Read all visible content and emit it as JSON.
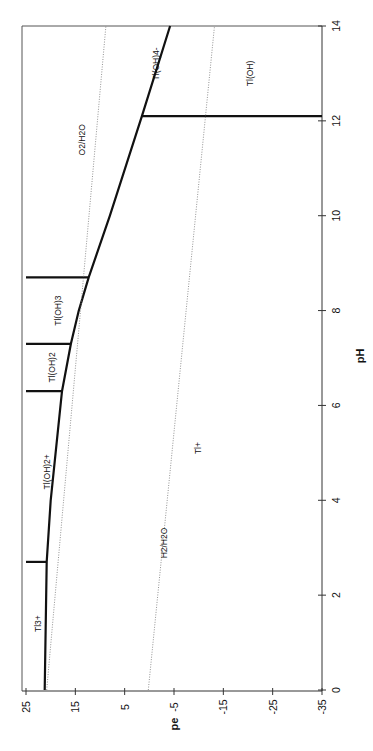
{
  "chart_data": {
    "type": "line",
    "title": "",
    "xlabel": "pH",
    "ylabel": "pe",
    "orientation_note": "figure rotated 90deg: pH axis vertical on right, pe axis horizontal along bottom",
    "xlim": [
      0,
      14
    ],
    "ylim": [
      -35,
      25
    ],
    "x_ticks": [
      "0",
      "2",
      "4",
      "6",
      "8",
      "10",
      "12",
      "14"
    ],
    "y_ticks": [
      "25",
      "15",
      "5",
      "-5",
      "-15",
      "-25",
      "-35"
    ],
    "grid": false,
    "series": [
      {
        "name": "Tl3+/Tl+ and hydroxo-Tl(III)/Tl+ boundary",
        "style": "solid-bold",
        "points": [
          [
            0,
            21.2
          ],
          [
            2.7,
            20.8
          ],
          [
            4.0,
            20.0
          ],
          [
            6.3,
            17.7
          ],
          [
            7.3,
            15.9
          ],
          [
            8.0,
            14.3
          ],
          [
            8.7,
            12.3
          ],
          [
            10.0,
            8.0
          ],
          [
            12.1,
            1.5
          ],
          [
            14,
            -4.2
          ]
        ]
      },
      {
        "name": "Tl3+ / Tl(OH)2+",
        "style": "solid-bold",
        "points": [
          [
            2.7,
            25
          ],
          [
            2.7,
            20.8
          ]
        ]
      },
      {
        "name": "Tl(OH)2+ / Tl(OH)2",
        "style": "solid-bold",
        "points": [
          [
            6.3,
            25
          ],
          [
            6.3,
            17.7
          ]
        ]
      },
      {
        "name": "Tl(OH)2 / Tl(OH)3",
        "style": "solid-bold",
        "points": [
          [
            7.3,
            25
          ],
          [
            7.3,
            15.9
          ]
        ]
      },
      {
        "name": "Tl(OH)3 / Tl(OH)4-",
        "style": "solid-bold",
        "points": [
          [
            8.7,
            25
          ],
          [
            8.7,
            12.3
          ]
        ]
      },
      {
        "name": "Tl+ / Tl(OH)",
        "style": "solid-bold",
        "points": [
          [
            12.1,
            1.5
          ],
          [
            12.1,
            -35
          ]
        ]
      },
      {
        "name": "O2/H2O",
        "style": "dotted",
        "points": [
          [
            0,
            20.8
          ],
          [
            14,
            8.8
          ]
        ]
      },
      {
        "name": "H2/H2O",
        "style": "dotted",
        "points": [
          [
            0,
            0.2
          ],
          [
            14,
            -13.2
          ]
        ]
      }
    ],
    "annotations": [
      {
        "text": "Tl3+",
        "pH": 1.4,
        "pe": 22.5
      },
      {
        "text": "Tl(OH)2+",
        "pH": 4.6,
        "pe": 20.5
      },
      {
        "text": "Tl(OH)2",
        "pH": 6.8,
        "pe": 19.5
      },
      {
        "text": "Tl(OH)3",
        "pH": 8.0,
        "pe": 18.3
      },
      {
        "text": "Tl(OH)4-",
        "pH": 13.2,
        "pe": -1.5
      },
      {
        "text": "O2/H2O",
        "pH": 11.6,
        "pe": 13.4
      },
      {
        "text": "H2/H2O",
        "pH": 3.1,
        "pe": -3.2
      },
      {
        "text": "Tl+",
        "pH": 5.1,
        "pe": -10.0
      },
      {
        "text": "Tl(OH)",
        "pH": 13.0,
        "pe": -20.5
      }
    ]
  },
  "axes": {
    "x_title": "pH",
    "y_title": "pe"
  }
}
